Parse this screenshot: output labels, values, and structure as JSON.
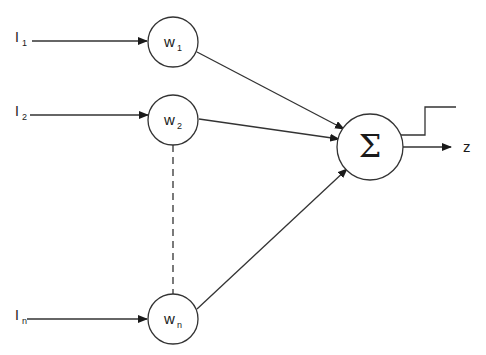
{
  "diagram": {
    "type": "perceptron",
    "stroke_color": "#333333",
    "background": "#ffffff",
    "inputs": [
      {
        "label": "I",
        "subscript": "1"
      },
      {
        "label": "I",
        "subscript": "2"
      },
      {
        "label": "I",
        "subscript": "n"
      }
    ],
    "weights": [
      {
        "label": "w",
        "subscript": "1"
      },
      {
        "label": "w",
        "subscript": "2"
      },
      {
        "label": "w",
        "subscript": "n"
      }
    ],
    "summation": {
      "symbol": "Σ"
    },
    "output": {
      "label": "z"
    },
    "activation": "step-function"
  }
}
